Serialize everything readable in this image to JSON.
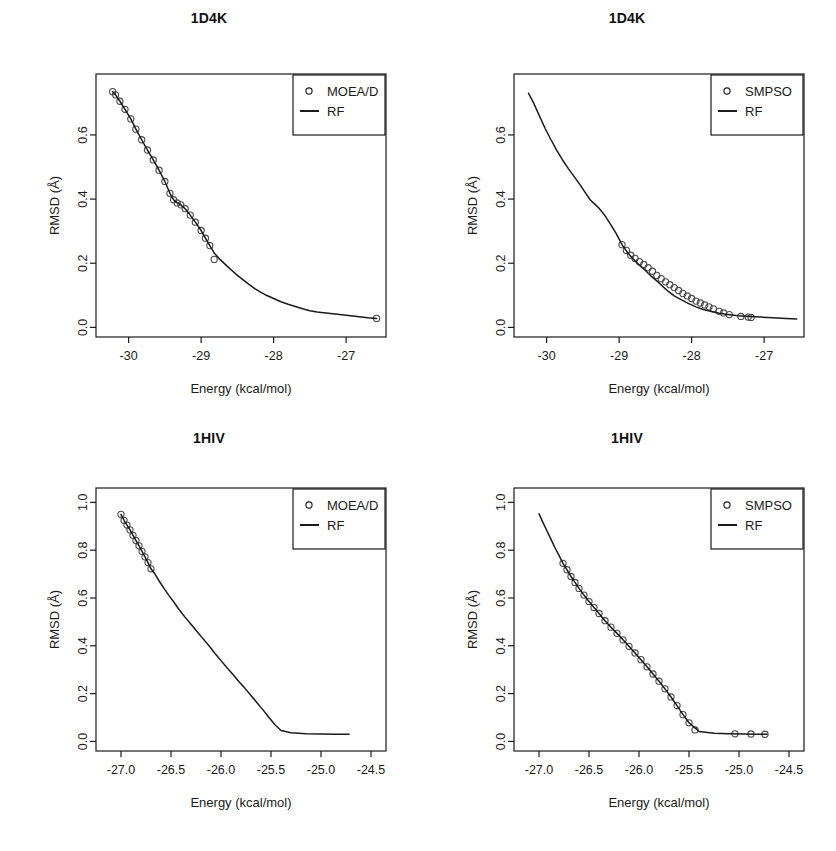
{
  "figure": {
    "width": 836,
    "height": 851,
    "background": "#ffffff",
    "ink_color": "#1a1a1a",
    "panel_count": 4
  },
  "chart_data": [
    {
      "id": "panel-top-left",
      "type": "line",
      "title": "1D4K",
      "xlabel": "Energy (kcal/mol)",
      "ylabel": "RMSD (Å)",
      "xlim": [
        -30.45,
        -26.45
      ],
      "ylim": [
        -0.03,
        0.79
      ],
      "xticks": [
        -30,
        -29,
        -28,
        -27
      ],
      "xticklabels": [
        "-30",
        "-29",
        "-28",
        "-27"
      ],
      "yticks": [
        0.0,
        0.2,
        0.4,
        0.6
      ],
      "yticklabels": [
        "0.0",
        "0.2",
        "0.4",
        "0.6"
      ],
      "grid": false,
      "legend": {
        "position": "top-right",
        "entries": [
          {
            "label": "MOEA/D",
            "marker": "circle"
          },
          {
            "label": "RF",
            "marker": "line"
          }
        ]
      },
      "series": [
        {
          "name": "RF",
          "marker": "line",
          "x": [
            -30.22,
            -30.18,
            -30.12,
            -30.05,
            -29.97,
            -29.9,
            -29.82,
            -29.74,
            -29.66,
            -29.58,
            -29.5,
            -29.43,
            -29.38,
            -29.33,
            -29.28,
            -29.22,
            -29.15,
            -29.08,
            -29.0,
            -28.94,
            -28.88,
            -28.82,
            -28.74,
            -28.66,
            -28.58,
            -28.5,
            -28.42,
            -28.34,
            -28.26,
            -28.18,
            -28.1,
            -28.0,
            -27.9,
            -27.8,
            -27.7,
            -27.6,
            -27.5,
            -27.4,
            -27.28,
            -27.15,
            -27.0,
            -26.85,
            -26.7,
            -26.58
          ],
          "y": [
            0.735,
            0.725,
            0.705,
            0.68,
            0.65,
            0.618,
            0.585,
            0.553,
            0.522,
            0.49,
            0.455,
            0.418,
            0.398,
            0.388,
            0.382,
            0.37,
            0.35,
            0.328,
            0.302,
            0.278,
            0.255,
            0.232,
            0.212,
            0.195,
            0.178,
            0.162,
            0.148,
            0.134,
            0.121,
            0.11,
            0.1,
            0.09,
            0.08,
            0.072,
            0.065,
            0.058,
            0.052,
            0.048,
            0.045,
            0.042,
            0.038,
            0.034,
            0.03,
            0.028
          ]
        },
        {
          "name": "MOEA/D",
          "marker": "circle",
          "note": "markers overlay the RF curve densely from the top of the curve to about RMSD 0.20, plus one isolated point at the right end",
          "x": [
            -30.22,
            -30.18,
            -30.12,
            -30.05,
            -29.97,
            -29.9,
            -29.82,
            -29.74,
            -29.66,
            -29.58,
            -29.5,
            -29.43,
            -29.38,
            -29.33,
            -29.28,
            -29.22,
            -29.15,
            -29.08,
            -29.0,
            -28.94,
            -28.88,
            -28.82,
            -26.58
          ],
          "y": [
            0.735,
            0.725,
            0.705,
            0.68,
            0.65,
            0.618,
            0.585,
            0.553,
            0.522,
            0.49,
            0.455,
            0.418,
            0.398,
            0.388,
            0.382,
            0.37,
            0.35,
            0.328,
            0.302,
            0.278,
            0.255,
            0.212,
            0.028
          ]
        }
      ]
    },
    {
      "id": "panel-top-right",
      "type": "line",
      "title": "1D4K",
      "xlabel": "Energy (kcal/mol)",
      "ylabel": "RMSD (Å)",
      "xlim": [
        -30.45,
        -26.45
      ],
      "ylim": [
        -0.03,
        0.79
      ],
      "xticks": [
        -30,
        -29,
        -28,
        -27
      ],
      "xticklabels": [
        "-30",
        "-29",
        "-28",
        "-27"
      ],
      "yticks": [
        0.0,
        0.2,
        0.4,
        0.6
      ],
      "yticklabels": [
        "0.0",
        "0.2",
        "0.4",
        "0.6"
      ],
      "grid": false,
      "legend": {
        "position": "top-right",
        "entries": [
          {
            "label": "SMPSO",
            "marker": "circle"
          },
          {
            "label": "RF",
            "marker": "line"
          }
        ]
      },
      "series": [
        {
          "name": "RF",
          "marker": "line",
          "x": [
            -30.25,
            -30.18,
            -30.1,
            -30.02,
            -29.94,
            -29.86,
            -29.78,
            -29.7,
            -29.62,
            -29.54,
            -29.46,
            -29.4,
            -29.34,
            -29.28,
            -29.2,
            -29.12,
            -29.04,
            -28.96,
            -28.88,
            -28.8,
            -28.72,
            -28.64,
            -28.56,
            -28.48,
            -28.4,
            -28.32,
            -28.24,
            -28.14,
            -28.04,
            -27.94,
            -27.84,
            -27.74,
            -27.62,
            -27.5,
            -27.36,
            -27.2,
            -27.04,
            -26.88,
            -26.7,
            -26.55
          ],
          "y": [
            0.73,
            0.7,
            0.66,
            0.62,
            0.585,
            0.552,
            0.522,
            0.495,
            0.47,
            0.445,
            0.418,
            0.398,
            0.385,
            0.372,
            0.35,
            0.322,
            0.292,
            0.258,
            0.232,
            0.212,
            0.194,
            0.178,
            0.16,
            0.145,
            0.128,
            0.112,
            0.098,
            0.086,
            0.074,
            0.064,
            0.056,
            0.05,
            0.044,
            0.04,
            0.036,
            0.034,
            0.032,
            0.03,
            0.028,
            0.026
          ]
        },
        {
          "name": "SMPSO",
          "marker": "circle",
          "note": "markers begin near RMSD 0.25 and run densely along the curve down to the flat tail, with separate points near -27.6 and -27.2",
          "x": [
            -28.96,
            -28.9,
            -28.84,
            -28.78,
            -28.72,
            -28.66,
            -28.6,
            -28.54,
            -28.48,
            -28.42,
            -28.36,
            -28.3,
            -28.24,
            -28.18,
            -28.12,
            -28.06,
            -28.0,
            -27.94,
            -27.88,
            -27.82,
            -27.76,
            -27.7,
            -27.62,
            -27.56,
            -27.48,
            -27.32,
            -27.22,
            -27.18
          ],
          "y": [
            0.258,
            0.24,
            0.225,
            0.215,
            0.205,
            0.196,
            0.186,
            0.175,
            0.162,
            0.152,
            0.142,
            0.133,
            0.124,
            0.115,
            0.106,
            0.098,
            0.09,
            0.082,
            0.076,
            0.07,
            0.064,
            0.058,
            0.05,
            0.045,
            0.04,
            0.034,
            0.032,
            0.031
          ]
        }
      ]
    },
    {
      "id": "panel-bottom-left",
      "type": "line",
      "title": "1HIV",
      "xlabel": "Energy (kcal/mol)",
      "ylabel": "RMSD (Å)",
      "xlim": [
        -27.25,
        -24.35
      ],
      "ylim": [
        -0.04,
        1.06
      ],
      "xticks": [
        -27.0,
        -26.5,
        -26.0,
        -25.5,
        -25.0,
        -24.5
      ],
      "xticklabels": [
        "-27.0",
        "-26.5",
        "-26.0",
        "-25.5",
        "-25.0",
        "-24.5"
      ],
      "yticks": [
        0.0,
        0.2,
        0.4,
        0.6,
        0.8,
        1.0
      ],
      "yticklabels": [
        "0.0",
        "0.2",
        "0.4",
        "0.6",
        "0.8",
        "1.0"
      ],
      "grid": false,
      "legend": {
        "position": "top-right",
        "entries": [
          {
            "label": "MOEA/D",
            "marker": "circle"
          },
          {
            "label": "RF",
            "marker": "line"
          }
        ]
      },
      "series": [
        {
          "name": "RF",
          "marker": "line",
          "x": [
            -27.0,
            -26.97,
            -26.94,
            -26.91,
            -26.88,
            -26.85,
            -26.82,
            -26.79,
            -26.76,
            -26.73,
            -26.7,
            -26.66,
            -26.62,
            -26.57,
            -26.52,
            -26.47,
            -26.42,
            -26.36,
            -26.3,
            -26.24,
            -26.18,
            -26.12,
            -26.06,
            -26.0,
            -25.94,
            -25.88,
            -25.82,
            -25.76,
            -25.7,
            -25.64,
            -25.58,
            -25.52,
            -25.46,
            -25.4,
            -25.3,
            -25.15,
            -25.0,
            -24.85,
            -24.72
          ],
          "y": [
            0.95,
            0.925,
            0.905,
            0.885,
            0.862,
            0.84,
            0.818,
            0.795,
            0.772,
            0.748,
            0.722,
            0.7,
            0.672,
            0.64,
            0.61,
            0.582,
            0.552,
            0.52,
            0.49,
            0.46,
            0.43,
            0.4,
            0.368,
            0.338,
            0.308,
            0.28,
            0.25,
            0.222,
            0.192,
            0.162,
            0.132,
            0.1,
            0.07,
            0.046,
            0.036,
            0.032,
            0.031,
            0.03,
            0.03
          ]
        },
        {
          "name": "MOEA/D",
          "marker": "circle",
          "note": "dense marker band only along the upper portion from about 0.95 down to 0.72",
          "x": [
            -27.0,
            -26.97,
            -26.94,
            -26.91,
            -26.88,
            -26.85,
            -26.82,
            -26.79,
            -26.76,
            -26.73,
            -26.7
          ],
          "y": [
            0.95,
            0.925,
            0.905,
            0.885,
            0.862,
            0.84,
            0.818,
            0.795,
            0.772,
            0.748,
            0.722
          ]
        }
      ]
    },
    {
      "id": "panel-bottom-right",
      "type": "line",
      "title": "1HIV",
      "xlabel": "Energy (kcal/mol)",
      "ylabel": "RMSD (Å)",
      "xlim": [
        -27.25,
        -24.35
      ],
      "ylim": [
        -0.04,
        1.06
      ],
      "xticks": [
        -27.0,
        -26.5,
        -26.0,
        -25.5,
        -25.0,
        -24.5
      ],
      "xticklabels": [
        "-27.0",
        "-26.5",
        "-26.0",
        "-25.5",
        "-25.0",
        "-24.5"
      ],
      "yticks": [
        0.0,
        0.2,
        0.4,
        0.6,
        0.8,
        1.0
      ],
      "yticklabels": [
        "0.0",
        "0.2",
        "0.4",
        "0.6",
        "0.8",
        "1.0"
      ],
      "grid": false,
      "legend": {
        "position": "top-right",
        "entries": [
          {
            "label": "SMPSO",
            "marker": "circle"
          },
          {
            "label": "RF",
            "marker": "line"
          }
        ]
      },
      "series": [
        {
          "name": "RF",
          "marker": "line",
          "x": [
            -27.0,
            -26.96,
            -26.92,
            -26.88,
            -26.84,
            -26.8,
            -26.76,
            -26.72,
            -26.68,
            -26.64,
            -26.6,
            -26.55,
            -26.5,
            -26.45,
            -26.4,
            -26.34,
            -26.28,
            -26.22,
            -26.16,
            -26.1,
            -26.04,
            -25.98,
            -25.92,
            -25.86,
            -25.8,
            -25.74,
            -25.68,
            -25.62,
            -25.56,
            -25.5,
            -25.4,
            -25.25,
            -25.1,
            -24.95,
            -24.8,
            -24.72
          ],
          "y": [
            0.952,
            0.915,
            0.88,
            0.845,
            0.81,
            0.778,
            0.745,
            0.718,
            0.69,
            0.665,
            0.64,
            0.612,
            0.585,
            0.56,
            0.535,
            0.505,
            0.478,
            0.452,
            0.425,
            0.398,
            0.37,
            0.342,
            0.312,
            0.282,
            0.252,
            0.22,
            0.186,
            0.15,
            0.112,
            0.078,
            0.042,
            0.034,
            0.032,
            0.031,
            0.03,
            0.03
          ]
        },
        {
          "name": "SMPSO",
          "marker": "circle",
          "note": "markers follow the curve from about 0.75 down to the tail; three isolated markers sit on the flat tail near -25.0 to -24.7",
          "x": [
            -26.76,
            -26.72,
            -26.68,
            -26.64,
            -26.6,
            -26.55,
            -26.5,
            -26.45,
            -26.4,
            -26.34,
            -26.28,
            -26.22,
            -26.16,
            -26.1,
            -26.04,
            -25.98,
            -25.92,
            -25.86,
            -25.8,
            -25.74,
            -25.68,
            -25.62,
            -25.56,
            -25.5,
            -25.44,
            -25.04,
            -24.88,
            -24.74
          ],
          "y": [
            0.745,
            0.718,
            0.69,
            0.665,
            0.64,
            0.612,
            0.585,
            0.56,
            0.535,
            0.505,
            0.478,
            0.452,
            0.425,
            0.398,
            0.37,
            0.342,
            0.312,
            0.282,
            0.252,
            0.22,
            0.186,
            0.15,
            0.112,
            0.078,
            0.048,
            0.032,
            0.031,
            0.03
          ]
        }
      ]
    }
  ]
}
